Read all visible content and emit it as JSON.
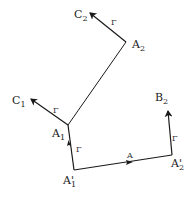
{
  "diagram": {
    "points": {
      "A2": {
        "label": "A",
        "sub": "2",
        "x": 126,
        "y": 42
      },
      "C2": {
        "label": "C",
        "sub": "2",
        "x": 90,
        "y": 12
      },
      "A1": {
        "label": "A",
        "sub": "1",
        "x": 68,
        "y": 125
      },
      "C1": {
        "label": "C",
        "sub": "1",
        "x": 30,
        "y": 98
      },
      "A1p": {
        "label": "A'",
        "sub": "1",
        "x": 74,
        "y": 170
      },
      "A2p": {
        "label": "A'",
        "sub": "2",
        "x": 172,
        "y": 155
      },
      "B2": {
        "label": "B",
        "sub": "2",
        "x": 168,
        "y": 110
      }
    },
    "edge_labels": {
      "gamma": "Γ",
      "a": "A"
    },
    "stroke_color": "#1a1a1a"
  }
}
